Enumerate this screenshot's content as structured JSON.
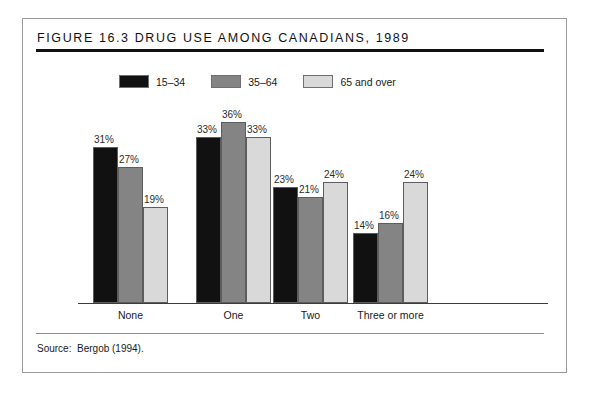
{
  "figure": {
    "title": "Figure 16.3 Drug Use among Canadians, 1989",
    "source": "Source:  Bergob (1994)."
  },
  "colors": {
    "series_1": "#111111",
    "series_2": "#848484",
    "series_3": "#d9d9d9",
    "bar_outline": "#5d5d5d",
    "frame": "#9a9a9a",
    "rule_thick": "#111111",
    "rule_thin": "#8c8c8c"
  },
  "chart_data": {
    "type": "bar",
    "title": "Figure 16.3 Drug Use among Canadians, 1989",
    "xlabel": "",
    "ylabel": "",
    "ylim": [
      0,
      40
    ],
    "grid": false,
    "legend_position": "top-left",
    "categories": [
      "None",
      "One",
      "Two",
      "Three or more"
    ],
    "series": [
      {
        "name": "15–34",
        "values": [
          31,
          33,
          23,
          14
        ],
        "labels": [
          "31%",
          "33%",
          "23%",
          "14%"
        ],
        "color": "#111111"
      },
      {
        "name": "35–64",
        "values": [
          27,
          36,
          21,
          16
        ],
        "labels": [
          "27%",
          "36%",
          "21%",
          "16%"
        ],
        "color": "#848484"
      },
      {
        "name": "65 and over",
        "values": [
          19,
          33,
          24,
          24
        ],
        "labels": [
          "19%",
          "33%",
          "24%",
          "24%"
        ],
        "color": "#d9d9d9"
      }
    ]
  }
}
